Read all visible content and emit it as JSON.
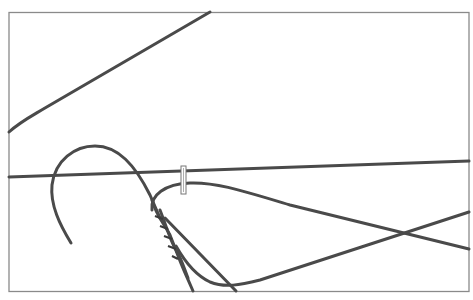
{
  "image": {
    "subject": "wire-hangers-line-drawing",
    "background_color": "#ffffff",
    "frame_color": "#888888",
    "wire_color": "#4a4a4a",
    "elements": [
      "frame",
      "diagonal-wire-top",
      "horizontal-wire",
      "hanger-hook",
      "twisted-neck",
      "hanger-shoulder",
      "crossing-wires",
      "clip"
    ]
  }
}
